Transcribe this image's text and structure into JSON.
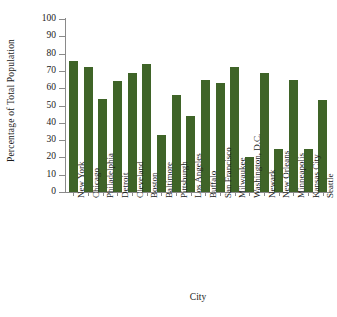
{
  "chart_data": {
    "type": "bar",
    "title": "",
    "xlabel": "City",
    "ylabel": "Percentage of Total Population",
    "ylim": [
      0,
      100
    ],
    "yticks": [
      0,
      10,
      20,
      30,
      40,
      50,
      60,
      70,
      80,
      90,
      100
    ],
    "grid": false,
    "legend": null,
    "bar_color": "#3f6428",
    "categories": [
      "New York",
      "Chicago",
      "Philadelphia",
      "Detroit",
      "Cleveland",
      "Boston",
      "Baltimore",
      "Pittsburgh",
      "Los Angeles",
      "Buffalo",
      "San Francisco",
      "Milwaukee",
      "Washington, D.C.",
      "Newark",
      "New Orleans",
      "Minneapolis",
      "Kansas City",
      "Seattle"
    ],
    "values": [
      76,
      72,
      54,
      64,
      69,
      74,
      33,
      56,
      44,
      65,
      63,
      72,
      20,
      69,
      25,
      65,
      25,
      53
    ]
  },
  "axis": {
    "x_title": "City",
    "y_title": "Percentage of Total Population",
    "y_tick_labels": [
      "0",
      "10",
      "20",
      "30",
      "40",
      "50",
      "60",
      "70",
      "80",
      "90",
      "100"
    ]
  }
}
